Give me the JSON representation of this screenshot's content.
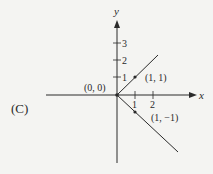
{
  "figure": {
    "panel_label": "(C)",
    "x_axis_label": "x",
    "y_axis_label": "y",
    "x_ticks": [
      "1",
      "2"
    ],
    "y_ticks": [
      "1",
      "2",
      "3"
    ],
    "points": [
      {
        "label": "(0, 0)",
        "x": 0,
        "y": 0
      },
      {
        "label": "(1, 1)",
        "x": 1,
        "y": 1
      },
      {
        "label": "(1, −1)",
        "x": 1,
        "y": -1
      }
    ],
    "rays": [
      {
        "from": [
          0,
          0
        ],
        "direction": [
          1,
          1
        ],
        "description": "y = x for x >= 0"
      },
      {
        "from": [
          0,
          0
        ],
        "direction": [
          1,
          -1
        ],
        "description": "y = -x for x >= 0"
      }
    ],
    "colors": {
      "axis": "#2a2a2a",
      "background": "#f4f4f2"
    }
  }
}
